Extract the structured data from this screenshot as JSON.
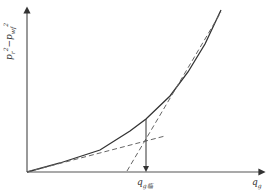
{
  "chart_data": {
    "type": "line",
    "title": "",
    "xlabel": "q_g",
    "ylabel": "p_r^2 - p_wf^2",
    "grid": false,
    "legend": null,
    "series": [
      {
        "name": "deliverability curve",
        "style": "solid",
        "points_px": [
          [
            27,
            172
          ],
          [
            60,
            163
          ],
          [
            100,
            150
          ],
          [
            130,
            131
          ],
          [
            146,
            119
          ],
          [
            170,
            96
          ],
          [
            188,
            72
          ],
          [
            205,
            44
          ],
          [
            221,
            10
          ]
        ]
      },
      {
        "name": "low-rate tangent",
        "style": "dashed",
        "points_px": [
          [
            27,
            172
          ],
          [
            165,
            136
          ]
        ]
      },
      {
        "name": "high-rate tangent",
        "style": "dashed",
        "points_px": [
          [
            127,
            171
          ],
          [
            221,
            12
          ]
        ]
      }
    ],
    "annotations": [
      {
        "type": "vertical-arrow",
        "x_px": 146,
        "from_y_px": 119,
        "to_y_px": 172,
        "label": "q_g临"
      }
    ]
  },
  "axes": {
    "y_label": {
      "base": "p",
      "sub1": "r",
      "sup1": "2",
      "minus": "−",
      "base2": "p",
      "sub2": "wf",
      "sup2": "2"
    },
    "x_label": {
      "base": "q",
      "sub": "g"
    },
    "critical_label": {
      "base": "q",
      "sub": "g临"
    }
  },
  "colors": {
    "line": "#333333",
    "dashed": "#666666",
    "axis": "#555555"
  }
}
